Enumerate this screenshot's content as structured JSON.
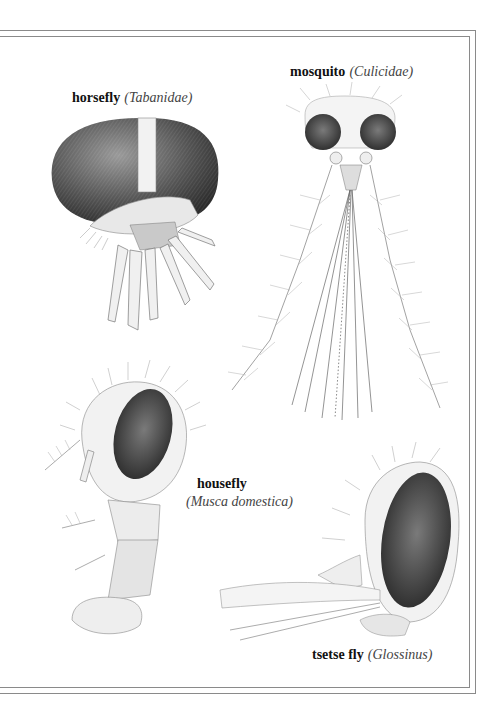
{
  "plate": {
    "frame": {
      "style": "double-rule",
      "color": "#8a8a8a"
    },
    "specimens": [
      {
        "id": "horsefly",
        "common_name": "horsefly",
        "scientific_name": "(Tabanidae)"
      },
      {
        "id": "mosquito",
        "common_name": "mosquito",
        "scientific_name": "(Culicidae)"
      },
      {
        "id": "housefly",
        "common_name": "housefly",
        "scientific_name": "(Musca domestica)"
      },
      {
        "id": "tsetse",
        "common_name": "tsetse fly",
        "scientific_name": "(Glossinus)"
      }
    ]
  },
  "colors": {
    "ink": "#1a1a1a",
    "eye_shade": "#3c3c3c",
    "mid_tone": "#8c8c8c",
    "light_tone": "#d6d6d6"
  }
}
